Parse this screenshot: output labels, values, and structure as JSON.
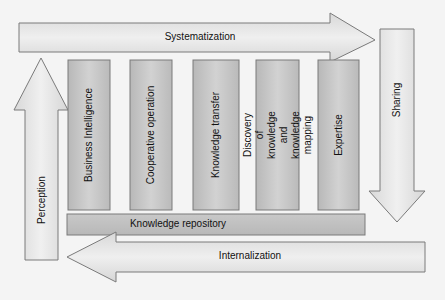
{
  "diagram": {
    "arrows": {
      "systematization": {
        "label": "Systematization",
        "direction": "right"
      },
      "sharing": {
        "label": "Sharing",
        "direction": "down"
      },
      "internalization": {
        "label": "Internalization",
        "direction": "left"
      },
      "perception": {
        "label": "Perception",
        "direction": "up"
      }
    },
    "columns": [
      {
        "label": "Business Intelligence"
      },
      {
        "label": "Cooperative operation"
      },
      {
        "label": "Knowledge transfer"
      },
      {
        "label": "Discovery of knowledge and knowledge mapping"
      },
      {
        "label": "Expertise"
      }
    ],
    "base": {
      "label": "Knowledge repository"
    },
    "colors": {
      "arrow_fill": "#e2e2e2",
      "box_fill": "#c4c4c4",
      "stroke": "#777777",
      "background": "#f4f4f4"
    }
  }
}
